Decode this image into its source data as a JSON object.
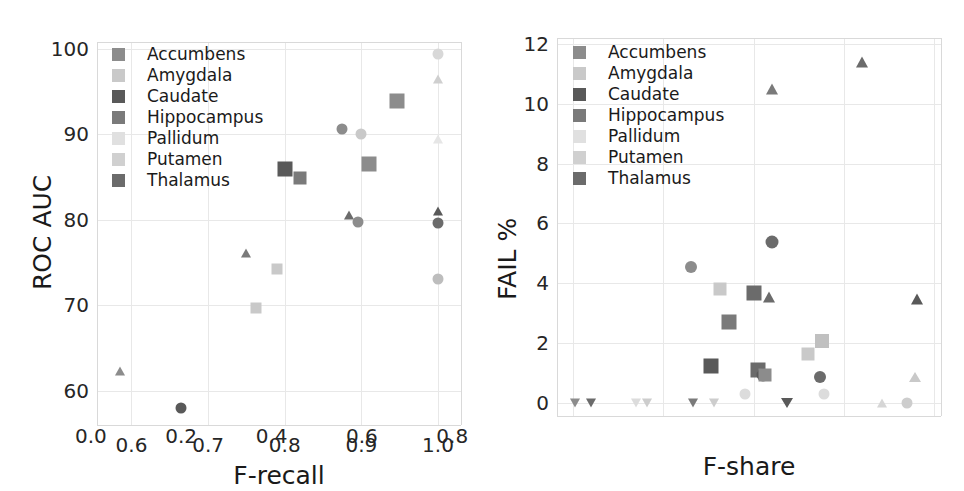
{
  "figure": {
    "width": 964,
    "height": 491,
    "background": "#ffffff"
  },
  "series_styles": [
    {
      "name": "Accumbens",
      "color": "#8c8c8c"
    },
    {
      "name": "Amygdala",
      "color": "#c9c9c9"
    },
    {
      "name": "Caudate",
      "color": "#595959"
    },
    {
      "name": "Hippocampus",
      "color": "#7a7a7a"
    },
    {
      "name": "Pallidum",
      "color": "#e0e0e0"
    },
    {
      "name": "Putamen",
      "color": "#d0d0d0"
    },
    {
      "name": "Thalamus",
      "color": "#6b6b6b"
    }
  ],
  "chart_data": [
    {
      "id": "left-panel",
      "type": "scatter",
      "title": "",
      "xlabel": "F-recall",
      "ylabel": "ROC AUC",
      "xlim": [
        0.555,
        1.03
      ],
      "ylim": [
        56.0,
        100.8
      ],
      "xticks": [
        0.6,
        0.7,
        0.8,
        0.9,
        1.0
      ],
      "xticklabels": [
        "0.6",
        "0.7",
        "0.8",
        "0.9",
        "1.0"
      ],
      "yticks": [
        60,
        70,
        80,
        90,
        100
      ],
      "yticklabels": [
        "60",
        "70",
        "80",
        "90",
        "100"
      ],
      "grid": true,
      "legend": {
        "position": "upper left",
        "entries": [
          "Accumbens",
          "Amygdala",
          "Caudate",
          "Hippocampus",
          "Pallidum",
          "Putamen",
          "Thalamus"
        ]
      },
      "points": [
        {
          "x": 0.585,
          "y": 62.3,
          "marker": "triangle-up",
          "color": "#8c8c8c",
          "size": 11,
          "series": "Accumbens"
        },
        {
          "x": 0.665,
          "y": 58.0,
          "marker": "circle",
          "color": "#595959",
          "size": 11,
          "series": "Caudate"
        },
        {
          "x": 0.75,
          "y": 76.1,
          "marker": "triangle-up",
          "color": "#7a7a7a",
          "size": 11,
          "series": "Hippocampus"
        },
        {
          "x": 0.763,
          "y": 69.7,
          "marker": "square",
          "color": "#c9c9c9",
          "size": 11,
          "series": "Amygdala"
        },
        {
          "x": 0.79,
          "y": 74.3,
          "marker": "square",
          "color": "#c9c9c9",
          "size": 11,
          "series": "Amygdala"
        },
        {
          "x": 0.8,
          "y": 85.9,
          "marker": "square",
          "color": "#595959",
          "size": 15,
          "series": "Caudate"
        },
        {
          "x": 0.82,
          "y": 84.9,
          "marker": "square",
          "color": "#7a7a7a",
          "size": 13,
          "series": "Hippocampus"
        },
        {
          "x": 0.875,
          "y": 90.6,
          "marker": "circle",
          "color": "#8c8c8c",
          "size": 11,
          "series": "Accumbens"
        },
        {
          "x": 0.884,
          "y": 80.6,
          "marker": "triangle-up",
          "color": "#6b6b6b",
          "size": 11,
          "series": "Thalamus"
        },
        {
          "x": 0.896,
          "y": 79.8,
          "marker": "circle",
          "color": "#8c8c8c",
          "size": 11,
          "series": "Accumbens"
        },
        {
          "x": 0.9,
          "y": 90.0,
          "marker": "circle",
          "color": "#c9c9c9",
          "size": 11,
          "series": "Amygdala"
        },
        {
          "x": 0.91,
          "y": 86.5,
          "marker": "square",
          "color": "#8c8c8c",
          "size": 15,
          "series": "Accumbens"
        },
        {
          "x": 0.947,
          "y": 93.9,
          "marker": "square",
          "color": "#8c8c8c",
          "size": 15,
          "series": "Accumbens"
        },
        {
          "x": 1.0,
          "y": 99.4,
          "marker": "circle",
          "color": "#d8d8d8",
          "size": 11,
          "series": "Pallidum"
        },
        {
          "x": 1.0,
          "y": 96.5,
          "marker": "triangle-up",
          "color": "#cfcfcf",
          "size": 11,
          "series": "Putamen"
        },
        {
          "x": 1.0,
          "y": 89.4,
          "marker": "triangle-up",
          "color": "#e6e6e6",
          "size": 11,
          "series": "Pallidum"
        },
        {
          "x": 1.0,
          "y": 81.0,
          "marker": "triangle-up",
          "color": "#595959",
          "size": 11,
          "series": "Caudate"
        },
        {
          "x": 1.0,
          "y": 79.6,
          "marker": "circle",
          "color": "#6b6b6b",
          "size": 11,
          "series": "Thalamus"
        },
        {
          "x": 1.0,
          "y": 73.1,
          "marker": "circle",
          "color": "#bdbdbd",
          "size": 11,
          "series": "Putamen"
        }
      ]
    },
    {
      "id": "right-panel",
      "type": "scatter",
      "title": "",
      "xlabel": "F-share",
      "ylabel": "FAIL %",
      "xlim": [
        -0.035,
        0.815
      ],
      "ylim": [
        -0.45,
        12.2
      ],
      "xticks": [
        0.0,
        0.2,
        0.4,
        0.6,
        0.8
      ],
      "xticklabels": [
        "0.0",
        "0.2",
        "0.4",
        "0.6",
        "0.8"
      ],
      "yticks": [
        0,
        2,
        4,
        6,
        8,
        10,
        12
      ],
      "yticklabels": [
        "0",
        "2",
        "4",
        "6",
        "8",
        "10",
        "12"
      ],
      "grid": true,
      "legend": {
        "position": "upper left",
        "entries": [
          "Accumbens",
          "Amygdala",
          "Caudate",
          "Hippocampus",
          "Pallidum",
          "Putamen",
          "Thalamus"
        ]
      },
      "points": [
        {
          "x": 0.005,
          "y": 0.0,
          "marker": "triangle-down",
          "color": "#8c8c8c",
          "size": 11,
          "series": "Accumbens"
        },
        {
          "x": 0.04,
          "y": 0.0,
          "marker": "triangle-down",
          "color": "#6b6b6b",
          "size": 11,
          "series": "Thalamus"
        },
        {
          "x": 0.14,
          "y": 0.0,
          "marker": "triangle-down",
          "color": "#dcdcdc",
          "size": 11,
          "series": "Pallidum"
        },
        {
          "x": 0.165,
          "y": 0.0,
          "marker": "triangle-down",
          "color": "#cdcdcd",
          "size": 11,
          "series": "Putamen"
        },
        {
          "x": 0.262,
          "y": 4.52,
          "marker": "circle",
          "color": "#8c8c8c",
          "size": 12,
          "series": "Accumbens"
        },
        {
          "x": 0.265,
          "y": 0.0,
          "marker": "triangle-down",
          "color": "#7a7a7a",
          "size": 11,
          "series": "Hippocampus"
        },
        {
          "x": 0.305,
          "y": 1.22,
          "marker": "square",
          "color": "#595959",
          "size": 15,
          "series": "Caudate"
        },
        {
          "x": 0.312,
          "y": 0.0,
          "marker": "triangle-down",
          "color": "#cdcdcd",
          "size": 11,
          "series": "Putamen"
        },
        {
          "x": 0.325,
          "y": 3.8,
          "marker": "square",
          "color": "#c9c9c9",
          "size": 13,
          "series": "Amygdala"
        },
        {
          "x": 0.345,
          "y": 2.7,
          "marker": "square",
          "color": "#7a7a7a",
          "size": 15,
          "series": "Hippocampus"
        },
        {
          "x": 0.382,
          "y": 0.28,
          "marker": "circle",
          "color": "#dcdcdc",
          "size": 11,
          "series": "Pallidum"
        },
        {
          "x": 0.4,
          "y": 3.68,
          "marker": "square",
          "color": "#6b6b6b",
          "size": 15,
          "series": "Thalamus"
        },
        {
          "x": 0.41,
          "y": 1.08,
          "marker": "square",
          "color": "#6b6b6b",
          "size": 15,
          "series": "Thalamus"
        },
        {
          "x": 0.42,
          "y": 0.92,
          "marker": "circle",
          "color": "#595959",
          "size": 13,
          "series": "Caudate"
        },
        {
          "x": 0.425,
          "y": 0.92,
          "marker": "square",
          "color": "#8c8c8c",
          "size": 13,
          "series": "Accumbens"
        },
        {
          "x": 0.435,
          "y": 3.52,
          "marker": "triangle-up",
          "color": "#6b6b6b",
          "size": 13,
          "series": "Thalamus"
        },
        {
          "x": 0.44,
          "y": 10.5,
          "marker": "triangle-up",
          "color": "#7a7a7a",
          "size": 13,
          "series": "Hippocampus"
        },
        {
          "x": 0.44,
          "y": 5.38,
          "marker": "circle",
          "color": "#6b6b6b",
          "size": 13,
          "series": "Thalamus"
        },
        {
          "x": 0.475,
          "y": 0.0,
          "marker": "triangle-down",
          "color": "#595959",
          "size": 12,
          "series": "Caudate"
        },
        {
          "x": 0.52,
          "y": 1.62,
          "marker": "square",
          "color": "#c9c9c9",
          "size": 13,
          "series": "Amygdala"
        },
        {
          "x": 0.548,
          "y": 0.85,
          "marker": "circle",
          "color": "#6b6b6b",
          "size": 12,
          "series": "Thalamus"
        },
        {
          "x": 0.552,
          "y": 2.05,
          "marker": "square",
          "color": "#c0c0c0",
          "size": 14,
          "series": "Putamen"
        },
        {
          "x": 0.555,
          "y": 0.28,
          "marker": "circle",
          "color": "#dcdcdc",
          "size": 11,
          "series": "Pallidum"
        },
        {
          "x": 0.64,
          "y": 11.4,
          "marker": "triangle-up",
          "color": "#6b6b6b",
          "size": 13,
          "series": "Thalamus"
        },
        {
          "x": 0.685,
          "y": 0.0,
          "marker": "triangle-up",
          "color": "#d6d6d6",
          "size": 11,
          "series": "Pallidum"
        },
        {
          "x": 0.74,
          "y": 0.0,
          "marker": "circle",
          "color": "#cdcdcd",
          "size": 11,
          "series": "Putamen"
        },
        {
          "x": 0.758,
          "y": 0.85,
          "marker": "triangle-up",
          "color": "#c9c9c9",
          "size": 12,
          "series": "Amygdala"
        },
        {
          "x": 0.762,
          "y": 3.48,
          "marker": "triangle-up",
          "color": "#595959",
          "size": 13,
          "series": "Caudate"
        }
      ]
    }
  ]
}
